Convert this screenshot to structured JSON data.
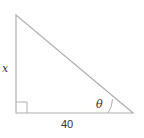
{
  "diagram": {
    "type": "right-triangle",
    "colors": {
      "stroke": "#b0b0b0",
      "text": "#333333",
      "background": "#ffffff"
    },
    "vertices": {
      "top": [
        16,
        15
      ],
      "right_angle": [
        16,
        113
      ],
      "angle_theta": [
        133,
        113
      ]
    },
    "labels": {
      "vertical_side": "x",
      "horizontal_side": "40",
      "angle": "θ"
    },
    "right_angle_marker": true
  }
}
